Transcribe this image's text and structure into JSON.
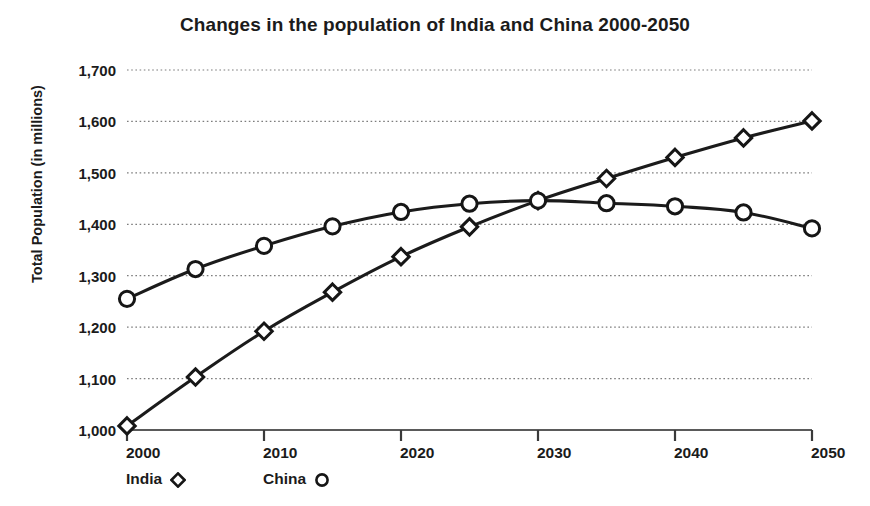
{
  "chart_data": {
    "type": "line",
    "title": "Changes in the population of India and China 2000-2050",
    "xlabel": "",
    "ylabel": "Total Population (in millions)",
    "x": [
      2000,
      2005,
      2010,
      2015,
      2020,
      2025,
      2030,
      2035,
      2040,
      2045,
      2050
    ],
    "xlim": [
      2000,
      2050
    ],
    "ylim": [
      1000,
      1700
    ],
    "xticks": [
      "2000",
      "2010",
      "2020",
      "2030",
      "2040",
      "2050"
    ],
    "xtick_values": [
      2000,
      2010,
      2020,
      2030,
      2040,
      2050
    ],
    "yticks": [
      "1,000",
      "1,100",
      "1,200",
      "1,300",
      "1,400",
      "1,500",
      "1,600",
      "1,700"
    ],
    "ytick_values": [
      1000,
      1100,
      1200,
      1300,
      1400,
      1500,
      1600,
      1700
    ],
    "grid": "horizontal-dotted",
    "legend_position": "below-axis-left",
    "series": [
      {
        "name": "India",
        "marker": "diamond",
        "color": "#1b1b1b",
        "values": [
          1008,
          1103,
          1192,
          1268,
          1337,
          1395,
          1446,
          1489,
          1530,
          1568,
          1601
        ]
      },
      {
        "name": "China",
        "marker": "circle",
        "color": "#1b1b1b",
        "values": [
          1255,
          1313,
          1358,
          1396,
          1424,
          1440,
          1446,
          1441,
          1435,
          1423,
          1392
        ]
      }
    ]
  },
  "legend": {
    "items": [
      {
        "label": "India",
        "marker": "diamond"
      },
      {
        "label": "China",
        "marker": "circle"
      }
    ]
  }
}
